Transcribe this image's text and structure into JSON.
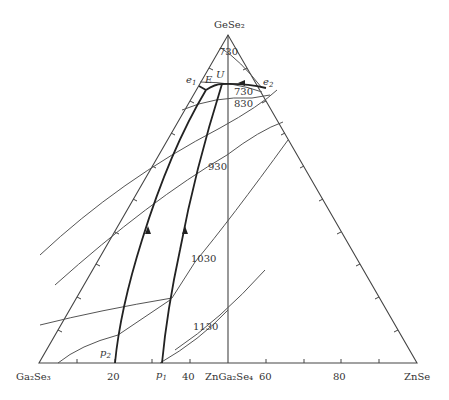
{
  "diagram": {
    "type": "ternary phase diagram",
    "vertices": {
      "top": "GeSe₂",
      "left": "Ga₂Se₃",
      "right": "ZnSe"
    },
    "base_axis": {
      "ticks": [
        20,
        40,
        60,
        80
      ],
      "tick_labels": [
        "20",
        "40",
        "60",
        "80"
      ],
      "compound_label": "ZnGa₂Se₄"
    },
    "points": {
      "e1": "e",
      "e1_sub": "1",
      "e2": "e",
      "e2_sub": "2",
      "E": "E",
      "U": "U",
      "p1": "p",
      "p1_sub": "1",
      "p2": "p",
      "p2_sub": "2"
    },
    "isotherms": [
      {
        "label": "730",
        "position": "top"
      },
      {
        "label": "730",
        "position": "near-e2"
      },
      {
        "label": "830"
      },
      {
        "label": "930"
      },
      {
        "label": "1030"
      },
      {
        "label": "1130"
      }
    ],
    "colors": {
      "lines": "#444444",
      "cotectics": "#222222",
      "text": "#333333"
    }
  }
}
